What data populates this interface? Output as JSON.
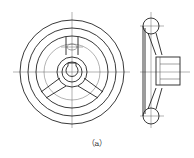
{
  "figure": {
    "caption": "（a）",
    "views": [
      {
        "name": "front-view",
        "description": "front view of handwheel"
      },
      {
        "name": "side-view",
        "description": "side section view of handwheel"
      }
    ]
  }
}
